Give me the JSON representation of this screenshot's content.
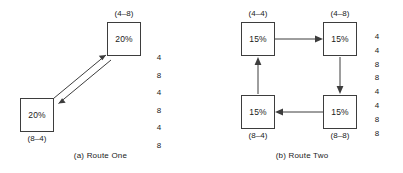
{
  "figure": {
    "width": 403,
    "height": 173,
    "background": "#ffffff",
    "stroke_color": "#3d3d3d",
    "text_color": "#1a1a1a"
  },
  "panels": [
    {
      "id": "route-one",
      "caption": "(a) Route One",
      "nodes": [
        {
          "id": "a-node-4-8",
          "label": "(4–8)",
          "value": "20%",
          "label_position": "above"
        },
        {
          "id": "a-node-8-4",
          "label": "(8–4)",
          "value": "20%",
          "label_position": "below"
        }
      ],
      "edges": [
        {
          "from": "(8–4)",
          "to": "(4–8)",
          "direction": "up-right"
        },
        {
          "from": "(4–8)",
          "to": "(8–4)",
          "direction": "down-left"
        }
      ],
      "sequence": [
        "4",
        "8",
        "4",
        "8",
        "4",
        "8"
      ]
    },
    {
      "id": "route-two",
      "caption": "(b) Route Two",
      "nodes": [
        {
          "id": "b-node-4-4",
          "label": "(4–4)",
          "value": "15%",
          "label_position": "above"
        },
        {
          "id": "b-node-4-8",
          "label": "(4–8)",
          "value": "15%",
          "label_position": "above"
        },
        {
          "id": "b-node-8-4",
          "label": "(8–4)",
          "value": "15%",
          "label_position": "below"
        },
        {
          "id": "b-node-8-8",
          "label": "(8–8)",
          "value": "15%",
          "label_position": "below"
        }
      ],
      "edges": [
        {
          "from": "(4–4)",
          "to": "(4–8)",
          "direction": "right"
        },
        {
          "from": "(4–8)",
          "to": "(8–8)",
          "direction": "down"
        },
        {
          "from": "(8–8)",
          "to": "(8–4)",
          "direction": "left"
        },
        {
          "from": "(8–4)",
          "to": "(4–4)",
          "direction": "up"
        }
      ],
      "sequence": [
        "4",
        "4",
        "8",
        "8",
        "4",
        "4",
        "8",
        "8"
      ]
    }
  ]
}
